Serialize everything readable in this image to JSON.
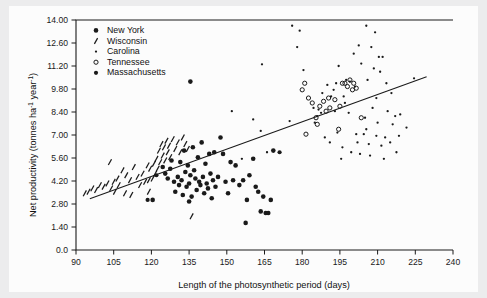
{
  "chart_data": {
    "type": "scatter",
    "title": "",
    "xlabel": "Length of the photosynthetic period (days)",
    "ylabel": "Net productivity (tonnes ha⁻¹ year⁻¹)",
    "xlim": [
      90,
      240
    ],
    "ylim": [
      0.0,
      14.0
    ],
    "xticks": [
      90,
      105,
      120,
      135,
      150,
      165,
      180,
      195,
      210,
      225,
      240
    ],
    "xtick_labels": [
      "90",
      "105",
      "120",
      "135",
      "150",
      "165",
      "180",
      "195",
      "210",
      "225",
      "240"
    ],
    "yticks": [
      0.0,
      1.4,
      2.8,
      4.2,
      5.6,
      7.0,
      8.4,
      9.8,
      11.2,
      12.6,
      14.0
    ],
    "ytick_labels": [
      "0.0",
      "1.40",
      "2.80",
      "4.20",
      "5.60",
      "7.00",
      "8.40",
      "9.80",
      "11.20",
      "12.60",
      "14.00"
    ],
    "grid": false,
    "legend_position": "upper-left-inside",
    "marker_color": "#1a1a1a",
    "line_color": "#1a1a1a",
    "trendline": {
      "name": "regression line",
      "x": [
        95.5,
        229.5
      ],
      "y": [
        3.12,
        10.55
      ]
    },
    "series": [
      {
        "name": "New York",
        "marker": "filled-circle",
        "marker_size": 3.4,
        "points": [
          [
            135.0,
            2.95
          ],
          [
            120.5,
            3.05
          ],
          [
            124.5,
            5.05
          ],
          [
            125.5,
            4.65
          ],
          [
            126.5,
            4.35
          ],
          [
            127.5,
            4.95
          ],
          [
            128.0,
            5.45
          ],
          [
            129.0,
            4.15
          ],
          [
            129.5,
            3.55
          ],
          [
            130.5,
            4.45
          ],
          [
            131.0,
            3.95
          ],
          [
            131.5,
            5.35
          ],
          [
            132.0,
            4.25
          ],
          [
            132.5,
            3.35
          ],
          [
            133.0,
            6.05
          ],
          [
            133.5,
            4.75
          ],
          [
            134.0,
            3.85
          ],
          [
            134.5,
            5.15
          ],
          [
            135.0,
            4.05
          ],
          [
            135.5,
            4.55
          ],
          [
            136.0,
            3.25
          ],
          [
            136.5,
            6.25
          ],
          [
            137.0,
            4.85
          ],
          [
            137.5,
            4.35
          ],
          [
            138.0,
            3.65
          ],
          [
            138.5,
            5.65
          ],
          [
            139.0,
            4.15
          ],
          [
            139.5,
            3.95
          ],
          [
            140.0,
            6.55
          ],
          [
            140.5,
            4.45
          ],
          [
            141.0,
            3.45
          ],
          [
            141.5,
            5.25
          ],
          [
            142.0,
            4.05
          ],
          [
            142.5,
            3.75
          ],
          [
            143.0,
            5.85
          ],
          [
            143.5,
            4.65
          ],
          [
            144.0,
            3.15
          ],
          [
            144.5,
            4.25
          ],
          [
            145.0,
            5.95
          ],
          [
            145.5,
            3.85
          ],
          [
            146.5,
            4.45
          ],
          [
            147.5,
            6.85
          ],
          [
            148.5,
            5.85
          ],
          [
            149.5,
            4.15
          ],
          [
            150.5,
            3.45
          ],
          [
            151.5,
            5.35
          ],
          [
            152.5,
            4.25
          ],
          [
            153.5,
            5.15
          ],
          [
            155.0,
            3.95
          ],
          [
            156.5,
            4.25
          ],
          [
            157.5,
            1.65
          ],
          [
            158.0,
            3.05
          ],
          [
            159.0,
            4.55
          ],
          [
            160.5,
            5.55
          ],
          [
            161.5,
            3.85
          ],
          [
            162.5,
            3.55
          ],
          [
            163.5,
            2.35
          ],
          [
            164.5,
            3.25
          ],
          [
            165.5,
            2.25
          ],
          [
            166.5,
            2.25
          ],
          [
            167.5,
            3.05
          ],
          [
            168.5,
            6.05
          ],
          [
            135.5,
            10.25
          ]
        ]
      },
      {
        "name": "Wisconsin",
        "marker": "slanted-dash",
        "marker_size": 4.2,
        "points": [
          [
            93.5,
            3.45
          ],
          [
            95.0,
            3.55
          ],
          [
            96.5,
            3.75
          ],
          [
            98.0,
            3.65
          ],
          [
            99.5,
            3.95
          ],
          [
            101.0,
            3.85
          ],
          [
            102.5,
            4.05
          ],
          [
            103.5,
            5.35
          ],
          [
            104.0,
            3.75
          ],
          [
            105.0,
            4.15
          ],
          [
            105.5,
            3.55
          ],
          [
            106.5,
            4.35
          ],
          [
            107.0,
            3.95
          ],
          [
            108.5,
            4.85
          ],
          [
            110.0,
            4.55
          ],
          [
            111.5,
            4.25
          ],
          [
            113.0,
            5.05
          ],
          [
            114.5,
            4.45
          ],
          [
            115.5,
            3.95
          ],
          [
            116.5,
            4.65
          ],
          [
            117.5,
            4.15
          ],
          [
            118.5,
            5.15
          ],
          [
            119.0,
            3.55
          ],
          [
            119.5,
            4.95
          ],
          [
            120.5,
            4.35
          ],
          [
            121.0,
            5.25
          ],
          [
            121.5,
            4.65
          ],
          [
            122.0,
            5.55
          ],
          [
            122.5,
            4.95
          ],
          [
            123.0,
            6.05
          ],
          [
            123.5,
            5.35
          ],
          [
            124.0,
            6.45
          ],
          [
            124.5,
            5.75
          ],
          [
            125.0,
            6.25
          ],
          [
            125.5,
            5.45
          ],
          [
            126.0,
            6.65
          ],
          [
            126.5,
            5.95
          ],
          [
            127.0,
            6.35
          ],
          [
            127.5,
            5.65
          ],
          [
            128.5,
            6.75
          ],
          [
            129.5,
            6.15
          ],
          [
            130.5,
            6.55
          ],
          [
            131.5,
            5.95
          ],
          [
            132.5,
            6.85
          ],
          [
            133.5,
            6.45
          ],
          [
            134.5,
            6.15
          ],
          [
            112.0,
            3.35
          ],
          [
            109.5,
            3.45
          ],
          [
            136.0,
            2.05
          ],
          [
            119.0,
            4.25
          ]
        ]
      },
      {
        "name": "Carolina",
        "marker": "small-dot",
        "marker_size": 1.6,
        "points": [
          [
            176.0,
            13.65
          ],
          [
            179.0,
            13.35
          ],
          [
            205.5,
            13.65
          ],
          [
            209.0,
            13.25
          ],
          [
            178.0,
            12.35
          ],
          [
            202.5,
            12.45
          ],
          [
            207.5,
            12.35
          ],
          [
            200.5,
            11.95
          ],
          [
            194.5,
            11.2
          ],
          [
            203.5,
            11.35
          ],
          [
            210.5,
            11.75
          ],
          [
            212.0,
            11.75
          ],
          [
            164.0,
            11.3
          ],
          [
            180.5,
            10.95
          ],
          [
            208.5,
            11.05
          ],
          [
            211.0,
            10.85
          ],
          [
            197.5,
            10.35
          ],
          [
            199.0,
            10.25
          ],
          [
            206.0,
            10.35
          ],
          [
            224.5,
            10.45
          ],
          [
            190.0,
            10.05
          ],
          [
            201.0,
            9.95
          ],
          [
            213.5,
            10.15
          ],
          [
            188.0,
            9.55
          ],
          [
            191.5,
            9.35
          ],
          [
            196.5,
            9.35
          ],
          [
            209.5,
            9.25
          ],
          [
            215.5,
            9.55
          ],
          [
            184.5,
            8.65
          ],
          [
            186.5,
            8.55
          ],
          [
            193.0,
            8.45
          ],
          [
            198.5,
            8.35
          ],
          [
            208.0,
            8.65
          ],
          [
            214.0,
            8.45
          ],
          [
            217.0,
            8.15
          ],
          [
            219.0,
            8.25
          ],
          [
            160.5,
            7.95
          ],
          [
            175.0,
            7.85
          ],
          [
            205.0,
            8.05
          ],
          [
            210.0,
            7.75
          ],
          [
            216.0,
            7.65
          ],
          [
            221.5,
            7.45
          ],
          [
            163.5,
            7.25
          ],
          [
            204.5,
            7.05
          ],
          [
            209.5,
            6.95
          ],
          [
            213.0,
            6.85
          ],
          [
            218.5,
            6.95
          ],
          [
            152.0,
            8.45
          ],
          [
            202.0,
            6.55
          ],
          [
            206.5,
            6.45
          ],
          [
            211.5,
            6.35
          ],
          [
            215.0,
            6.55
          ],
          [
            199.5,
            5.95
          ],
          [
            203.0,
            5.85
          ],
          [
            207.0,
            5.75
          ],
          [
            212.5,
            5.55
          ],
          [
            195.5,
            5.55
          ],
          [
            217.5,
            5.95
          ],
          [
            187.5,
            8.35
          ],
          [
            192.5,
            9.75
          ],
          [
            197.0,
            8.95
          ],
          [
            185.0,
            7.75
          ],
          [
            156.0,
            5.55
          ],
          [
            194.0,
            7.15
          ],
          [
            189.0,
            6.85
          ],
          [
            191.0,
            6.55
          ],
          [
            196.0,
            6.25
          ],
          [
            201.5,
            7.05
          ],
          [
            205.5,
            7.35
          ],
          [
            166.0,
            5.95
          ],
          [
            193.5,
            10.15
          ],
          [
            186.0,
            8.15
          ]
        ]
      },
      {
        "name": "Tennessee",
        "marker": "open-circle",
        "marker_size": 3.2,
        "points": [
          [
            181.0,
            10.15
          ],
          [
            180.0,
            9.75
          ],
          [
            182.5,
            9.25
          ],
          [
            188.5,
            9.05
          ],
          [
            190.5,
            9.25
          ],
          [
            193.0,
            9.15
          ],
          [
            196.0,
            10.15
          ],
          [
            197.0,
            10.15
          ],
          [
            199.0,
            10.35
          ],
          [
            200.5,
            10.15
          ],
          [
            200.0,
            9.75
          ],
          [
            187.0,
            8.75
          ],
          [
            189.5,
            8.45
          ],
          [
            191.0,
            8.65
          ],
          [
            195.0,
            8.75
          ],
          [
            185.5,
            8.05
          ],
          [
            186.0,
            7.65
          ],
          [
            194.5,
            7.35
          ],
          [
            181.5,
            7.05
          ],
          [
            203.5,
            8.05
          ],
          [
            198.0,
            9.95
          ],
          [
            184.0,
            8.95
          ],
          [
            201.5,
            9.85
          ]
        ]
      },
      {
        "name": "Massachusetts",
        "marker": "filled-circle",
        "marker_size": 3.0,
        "points": [
          [
            118.5,
            3.05
          ],
          [
            122.0,
            4.55
          ],
          [
            171.0,
            5.95
          ]
        ]
      }
    ]
  },
  "legend": {
    "items": [
      {
        "label": "New York",
        "marker": "filled-circle"
      },
      {
        "label": "Wisconsin",
        "marker": "slanted-dash"
      },
      {
        "label": "Carolina",
        "marker": "small-dot"
      },
      {
        "label": "Tennessee",
        "marker": "open-circle"
      },
      {
        "label": "Massachusetts",
        "marker": "filled-circle"
      }
    ]
  },
  "axes": {
    "x_title": "Length of the photosynthetic period (days)",
    "y_title_main": "Net productivity (tonnes ha",
    "y_title_sup1": "-1",
    "y_title_mid": " year",
    "y_title_sup2": "-1",
    "y_title_end": ")"
  },
  "colors": {
    "figure_background": "#ececed",
    "plate_background": "#fcfcfc",
    "ink": "#1a1a1a",
    "axis": "#1a1a1a"
  }
}
